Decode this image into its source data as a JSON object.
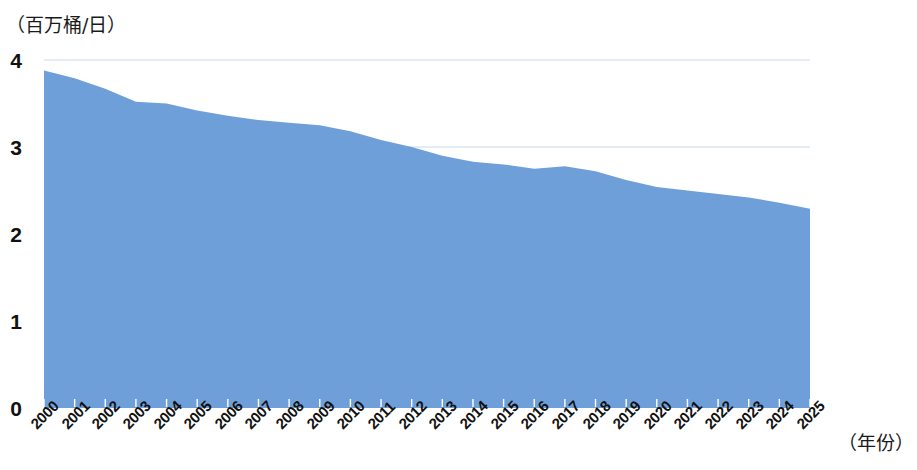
{
  "axes": {
    "y_unit_label": "（百万桶/日）",
    "x_unit_label": "（年份）",
    "y_ticks": [
      "0",
      "1",
      "2",
      "3",
      "4"
    ]
  },
  "style": {
    "series_fill": "#6f9fd8",
    "gridline_color": "#c9d8e8",
    "text_color": "#111111"
  },
  "chart_data": {
    "type": "area",
    "title": "",
    "subtitle": "",
    "xlabel": "（年份）",
    "ylabel": "（百万桶/日）",
    "xlim": [
      2000,
      2025
    ],
    "ylim": [
      0,
      4
    ],
    "yticks": [
      0,
      1,
      2,
      3,
      4
    ],
    "grid": true,
    "grid_axis": "y",
    "legend": false,
    "legend_position": "none",
    "categories": [
      "2000",
      "2001",
      "2002",
      "2003",
      "2004",
      "2005",
      "2006",
      "2007",
      "2008",
      "2009",
      "2010",
      "2011",
      "2012",
      "2013",
      "2014",
      "2015",
      "2016",
      "2017",
      "2018",
      "2019",
      "2020",
      "2021",
      "2022",
      "2023",
      "2024",
      "2025"
    ],
    "values": [
      3.88,
      3.79,
      3.67,
      3.52,
      3.5,
      3.42,
      3.36,
      3.31,
      3.28,
      3.25,
      3.18,
      3.08,
      3.0,
      2.9,
      2.83,
      2.8,
      2.75,
      2.78,
      2.72,
      2.62,
      2.54,
      2.5,
      2.46,
      2.42,
      2.36,
      2.29
    ],
    "series": [
      {
        "name": "",
        "values": [
          3.88,
          3.79,
          3.67,
          3.52,
          3.5,
          3.42,
          3.36,
          3.31,
          3.28,
          3.25,
          3.18,
          3.08,
          3.0,
          2.9,
          2.83,
          2.8,
          2.75,
          2.78,
          2.72,
          2.62,
          2.54,
          2.5,
          2.46,
          2.42,
          2.36,
          2.29
        ]
      }
    ]
  }
}
